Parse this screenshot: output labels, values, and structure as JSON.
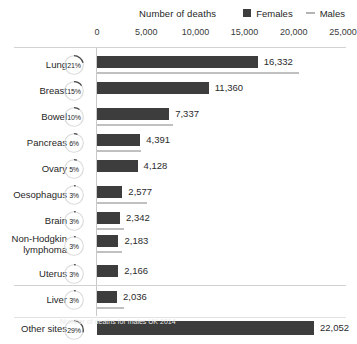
{
  "header": {
    "axis_title": "Number of deaths",
    "legend": [
      {
        "label": "Females",
        "marker": "square-swatch-icon",
        "color": "#3d3d3d"
      },
      {
        "label": "Males",
        "marker": "line-swatch-icon",
        "color": "#b4b4b4"
      }
    ]
  },
  "caption": "Number of deaths for males UK 2014",
  "chart_data": {
    "type": "bar",
    "orientation": "horizontal",
    "title": "Number of deaths",
    "xlabel": "Number of deaths",
    "ylabel": "",
    "xlim": [
      0,
      25000
    ],
    "xticks": [
      0,
      5000,
      10000,
      15000,
      20000,
      25000
    ],
    "xtick_labels": [
      "0",
      "5,000",
      "10,000",
      "15,000",
      "20,000",
      "25,000"
    ],
    "grid": false,
    "legend_position": "top-right",
    "categories": [
      "Lung",
      "Breast",
      "Bowel",
      "Pancreas",
      "Ovary",
      "Oesophagus",
      "Brain",
      "Non-Hodgkin\nlymphoma",
      "Uterus",
      "Liver",
      "Other sites"
    ],
    "series": [
      {
        "name": "Females",
        "values": [
          16332,
          11360,
          7337,
          4391,
          4128,
          2577,
          2342,
          2183,
          2166,
          2036,
          22052
        ]
      },
      {
        "name": "Males",
        "values": [
          20500,
          null,
          7700,
          4500,
          null,
          5100,
          2700,
          2500,
          null,
          2700,
          null
        ]
      }
    ],
    "value_labels": [
      "16,332",
      "11,360",
      "7,337",
      "4,391",
      "4,128",
      "2,577",
      "2,342",
      "2,183",
      "2,166",
      "2,036",
      "22,052"
    ],
    "percentages": [
      "21%",
      "15%",
      "10%",
      "6%",
      "5%",
      "3%",
      "3%",
      "3%",
      "3%",
      "3%",
      "29%"
    ],
    "percentage_values": [
      21,
      15,
      10,
      6,
      5,
      3,
      3,
      3,
      3,
      3,
      29
    ]
  },
  "colors": {
    "female_bar": "#3d3d3d",
    "male_line": "#c0c0c0",
    "rule": "#d2d2d2",
    "text": "#1f1f1f"
  }
}
